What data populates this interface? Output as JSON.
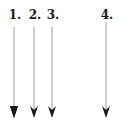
{
  "arrows": [
    {
      "label": "1.",
      "x": 14
    },
    {
      "label": "2.",
      "x": 34
    },
    {
      "label": "3.",
      "x": 52
    },
    {
      "label": "4.",
      "x": 106
    }
  ],
  "colors": {
    "line": "#9a9a9a",
    "head": "#1a1a1a",
    "text": "#1a1a1a"
  }
}
